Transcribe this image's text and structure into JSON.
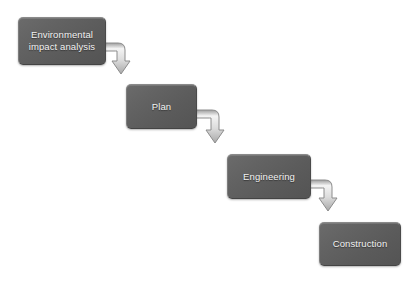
{
  "diagram": {
    "type": "flowchart",
    "background_color": "#ffffff",
    "node_fill_color": "#5f5f5f",
    "node_text_color": "#f2f2f2",
    "connector_fill_color": "#e8e8e8",
    "connector_stroke_color": "#8c8c8c",
    "nodes": [
      {
        "id": "eia",
        "label": "Environmental\nimpact analysis"
      },
      {
        "id": "plan",
        "label": "Plan"
      },
      {
        "id": "engineering",
        "label": "Engineering"
      },
      {
        "id": "construction",
        "label": "Construction"
      }
    ],
    "connectors": [
      {
        "id": "eia-to-plan",
        "from": "eia",
        "to": "plan",
        "shape": "elbow-right-down",
        "arrowhead": "down"
      },
      {
        "id": "plan-to-engineering",
        "from": "plan",
        "to": "engineering",
        "shape": "elbow-right-down",
        "arrowhead": "down"
      },
      {
        "id": "engineering-to-construction",
        "from": "engineering",
        "to": "construction",
        "shape": "elbow-right-down",
        "arrowhead": "down"
      }
    ]
  }
}
